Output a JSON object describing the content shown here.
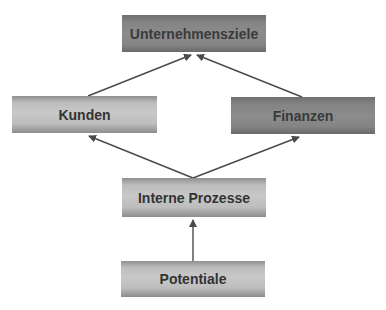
{
  "diagram": {
    "nodes": [
      {
        "id": "unternehmensziele",
        "label": "Unternehmensziele",
        "style": "dark"
      },
      {
        "id": "kunden",
        "label": "Kunden",
        "style": "light"
      },
      {
        "id": "finanzen",
        "label": "Finanzen",
        "style": "dark"
      },
      {
        "id": "interne_prozesse",
        "label": "Interne Prozesse",
        "style": "light"
      },
      {
        "id": "potentiale",
        "label": "Potentiale",
        "style": "light"
      }
    ],
    "edges": [
      {
        "from": "kunden",
        "to": "unternehmensziele"
      },
      {
        "from": "finanzen",
        "to": "unternehmensziele"
      },
      {
        "from": "interne_prozesse",
        "to": "kunden"
      },
      {
        "from": "interne_prozesse",
        "to": "finanzen"
      },
      {
        "from": "potentiale",
        "to": "interne_prozesse"
      }
    ],
    "colors": {
      "arrow": "#4a4a4a",
      "light_box": "#c4c4c4",
      "dark_box": "#888888",
      "text": "#333333"
    }
  }
}
